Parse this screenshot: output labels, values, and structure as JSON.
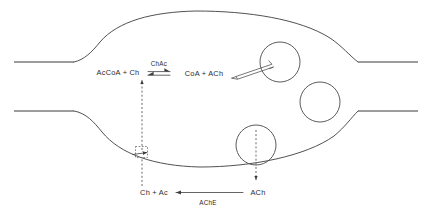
{
  "diagram": {
    "background_color": "#ffffff",
    "line_color": "#3d3d3d",
    "labels": {
      "substrate_left": "AcCoA + Ch",
      "enzyme_synthesis": "ChAc",
      "product_right": "CoA + ACh",
      "hydrolysis_products": "Ch + Ac",
      "enzyme_hydrolysis": "AChE",
      "released_transmitter": "ACh"
    },
    "structures": {
      "terminal": "presynaptic-terminal-bouton",
      "axon_upper": "axon-membrane-upper",
      "axon_lower": "axon-membrane-lower",
      "vesicles": [
        {
          "name": "vesicle-upper-left",
          "cx": 280,
          "cy": 62,
          "r": 20
        },
        {
          "name": "vesicle-upper-right",
          "cx": 320,
          "cy": 102,
          "r": 20
        },
        {
          "name": "vesicle-docked",
          "cx": 256,
          "cy": 145,
          "r": 20
        }
      ],
      "transporter": "choline-reuptake-transporter"
    },
    "arrows": {
      "equilibrium": "ChAc equilibrium double arrow",
      "vesicle_loading": "ACh transport into vesicle",
      "release": "ACh release into synaptic cleft",
      "reuptake": "choline reuptake into terminal",
      "hydrolysis": "AChE hydrolysis of ACh"
    }
  }
}
